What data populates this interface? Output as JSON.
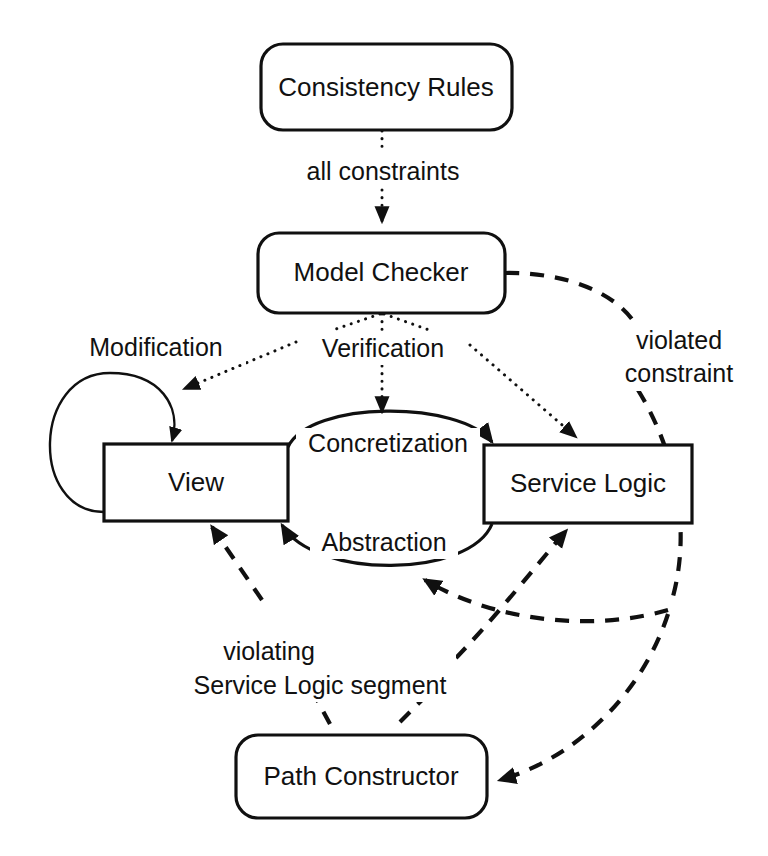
{
  "diagram": {
    "background_color": "#ffffff",
    "line_color": "#101010",
    "nodes": [
      {
        "id": "consistency_rules",
        "label": "Consistency  Rules",
        "shape": "rounded-rectangle",
        "x": 261,
        "y": 44,
        "w": 251,
        "h": 86
      },
      {
        "id": "model_checker",
        "label": "Model Checker",
        "shape": "rounded-rectangle",
        "x": 258,
        "y": 233,
        "w": 247,
        "h": 80
      },
      {
        "id": "view",
        "label": "View",
        "shape": "rectangle",
        "x": 104,
        "y": 444,
        "w": 184,
        "h": 77
      },
      {
        "id": "service_logic",
        "label": "Service Logic",
        "shape": "rectangle",
        "x": 484,
        "y": 445,
        "w": 208,
        "h": 78
      },
      {
        "id": "path_constructor",
        "label": "Path Constructor",
        "shape": "rounded-rectangle",
        "x": 236,
        "y": 735,
        "w": 251,
        "h": 83
      }
    ],
    "edge_labels": [
      {
        "id": "all_constraints",
        "text": "all constraints",
        "x": 382,
        "y": 172,
        "style": "dotted"
      },
      {
        "id": "modification",
        "text": "Modification",
        "x": 155,
        "y": 348,
        "style": "solid"
      },
      {
        "id": "verification",
        "text": "Verification",
        "x": 382,
        "y": 349,
        "style": "dotted"
      },
      {
        "id": "concretization",
        "text": "Concretization",
        "x": 387,
        "y": 444,
        "style": "solid"
      },
      {
        "id": "abstraction",
        "text": "Abstraction",
        "x": 383,
        "y": 543,
        "style": "solid"
      },
      {
        "id": "violated_constraint_line1",
        "text": "violated",
        "x": 678,
        "y": 341,
        "style": "dashed"
      },
      {
        "id": "violated_constraint_line2",
        "text": "constraint",
        "x": 678,
        "y": 374,
        "style": "dashed"
      },
      {
        "id": "violating_line1",
        "text": "violating",
        "x": 270,
        "y": 652,
        "style": "dashed"
      },
      {
        "id": "violating_line2",
        "text": "Service Logic segment",
        "x": 315,
        "y": 686,
        "style": "dashed"
      }
    ],
    "edges": [
      {
        "id": "rules-to-checker",
        "from": "consistency_rules",
        "to": "model_checker",
        "label": "all constraints",
        "style": "dotted",
        "arrow": true
      },
      {
        "id": "checker-to-view",
        "from": "model_checker",
        "to": "view",
        "label": "Verification",
        "style": "dotted",
        "arrow": true
      },
      {
        "id": "checker-to-middle",
        "from": "model_checker",
        "to": "concretization-arc",
        "label": "Verification",
        "style": "dotted",
        "arrow": true
      },
      {
        "id": "checker-to-service",
        "from": "model_checker",
        "to": "service_logic",
        "label": "Verification",
        "style": "dotted",
        "arrow": true
      },
      {
        "id": "view-self-loop",
        "from": "view",
        "to": "view",
        "label": "Modification",
        "style": "solid",
        "arrow": true
      },
      {
        "id": "view-to-service",
        "from": "view",
        "to": "service_logic",
        "label": "Concretization",
        "style": "solid",
        "arrow": true
      },
      {
        "id": "service-to-view",
        "from": "service_logic",
        "to": "view",
        "label": "Abstraction",
        "style": "solid",
        "arrow": true
      },
      {
        "id": "checker-to-path",
        "from": "model_checker",
        "to": "path_constructor",
        "label": "violated constraint",
        "style": "dashed",
        "arrow": true
      },
      {
        "id": "path-to-view",
        "from": "path_constructor",
        "to": "view",
        "label": "violating Service Logic segment",
        "style": "dashed",
        "arrow": true
      },
      {
        "id": "path-to-service",
        "from": "path_constructor",
        "to": "service_logic",
        "label": "violating Service Logic segment",
        "style": "dashed",
        "arrow": true
      },
      {
        "id": "path-to-abstraction",
        "from": "path_constructor",
        "to": "abstraction-arc",
        "label": "",
        "style": "dashed",
        "arrow": true
      }
    ]
  }
}
